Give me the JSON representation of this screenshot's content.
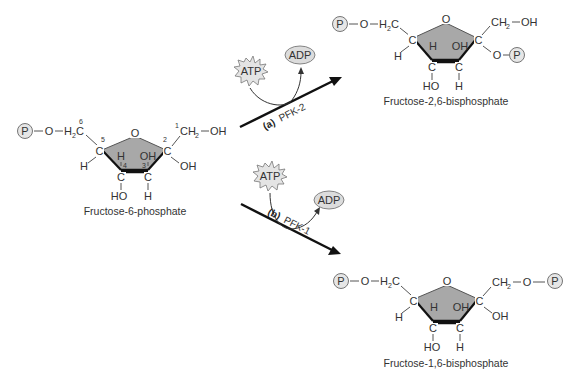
{
  "diagram": {
    "type": "biochemical-reaction",
    "substrate": {
      "name": "Fructose-6-phosphate",
      "phosphate_label": "P",
      "carbon_numbers": [
        "1",
        "2",
        "3",
        "4",
        "5",
        "6"
      ]
    },
    "reactions": [
      {
        "id": "a",
        "label": "(a)",
        "enzyme": "PFK-2",
        "cofactor_in": "ATP",
        "cofactor_out": "ADP",
        "product": "Fructose-2,6-bisphosphate"
      },
      {
        "id": "b",
        "label": "(b)",
        "enzyme": "PFK-1",
        "cofactor_in": "ATP",
        "cofactor_out": "ADP",
        "product": "Fructose-1,6-bisphosphate"
      }
    ],
    "atoms": {
      "P": "P",
      "O": "O",
      "H": "H",
      "C": "C",
      "OH": "OH",
      "HO": "HO",
      "H2C_main": "H",
      "H2C_sub": "2",
      "H2C_c": "C",
      "CH2_c": "CH",
      "CH2_sub": "2"
    },
    "colors": {
      "ring_fill": "#a8a8a8",
      "phosphate_fill": "#e6e6e6",
      "arrow": "#111111",
      "text": "#333333"
    }
  }
}
